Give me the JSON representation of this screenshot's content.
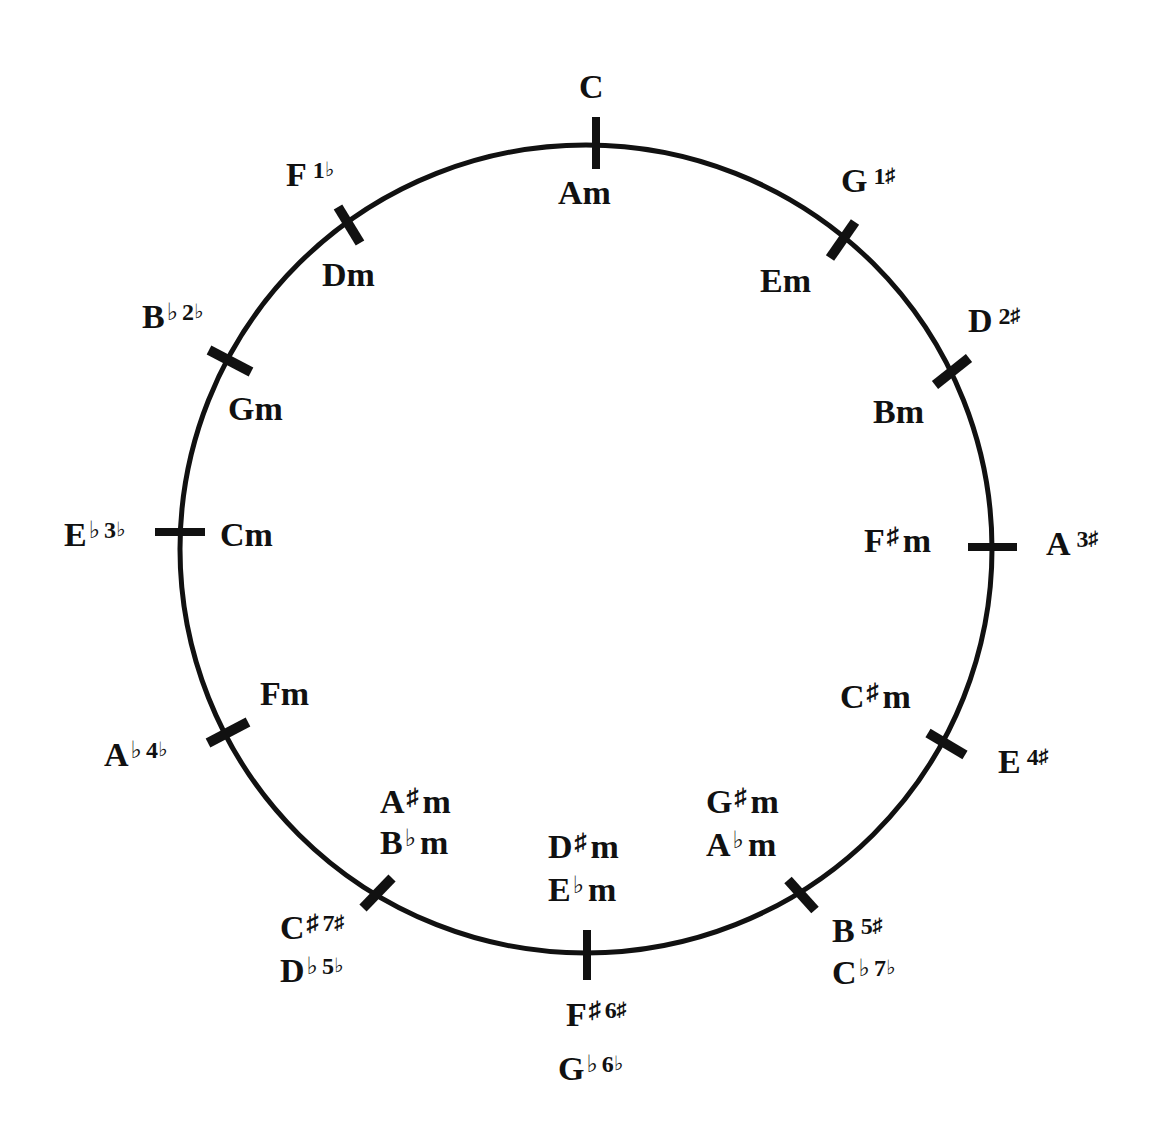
{
  "colors": {
    "ink": "#111111",
    "background": "#ffffff"
  },
  "circle": {
    "cx": 586,
    "cy": 549,
    "rx": 406,
    "ry": 404,
    "stroke_width": 5
  },
  "positions": [
    {
      "index": 0,
      "major": "C",
      "major_signature": "",
      "minor": [
        "Am"
      ],
      "tick_angle_deg": -89
    },
    {
      "index": 1,
      "major": "G",
      "major_signature": "1♯",
      "minor": [
        "Em"
      ],
      "tick_angle_deg": -58
    },
    {
      "index": 2,
      "major": "D",
      "major_signature": "2♯",
      "minor": [
        "Bm"
      ],
      "tick_angle_deg": -28
    },
    {
      "index": 3,
      "major": "A",
      "major_signature": "3♯",
      "minor": [
        "F♯m"
      ],
      "tick_angle_deg": 0
    },
    {
      "index": 4,
      "major": "E",
      "major_signature": "4♯",
      "minor": [
        "C♯m"
      ],
      "tick_angle_deg": 30
    },
    {
      "index": 5,
      "major": "B",
      "major_signature": "5♯",
      "enharmonic_major": "C♭",
      "enharmonic_signature": "7♭",
      "minor": [
        "G♯m",
        "A♭m"
      ],
      "tick_angle_deg": 59
    },
    {
      "index": 6,
      "major": "F♯",
      "major_signature": "6♯",
      "enharmonic_major": "G♭",
      "enharmonic_signature": "6♭",
      "minor": [
        "D♯m",
        "E♭m"
      ],
      "tick_angle_deg": 90
    },
    {
      "index": 7,
      "major": "C♯",
      "major_signature": "7♯",
      "enharmonic_major": "D♭",
      "enharmonic_signature": "5♭",
      "minor": [
        "A♯m",
        "B♭m"
      ],
      "tick_angle_deg": 122
    },
    {
      "index": 8,
      "major": "A♭",
      "major_signature": "4♭",
      "minor": [
        "Fm"
      ],
      "tick_angle_deg": 150
    },
    {
      "index": 9,
      "major": "E♭",
      "major_signature": "3♭",
      "minor": [
        "Cm"
      ],
      "tick_angle_deg": 180
    },
    {
      "index": 10,
      "major": "B♭",
      "major_signature": "2♭",
      "minor": [
        "Gm"
      ],
      "tick_angle_deg": -150
    },
    {
      "index": 11,
      "major": "F",
      "major_signature": "1♭",
      "minor": [
        "Dm"
      ],
      "tick_angle_deg": -120
    }
  ],
  "labels": {
    "C": {
      "letter": "C",
      "acc": "",
      "num": "",
      "numacc": ""
    },
    "Am": {
      "letter": "Am",
      "acc": ""
    },
    "G": {
      "letter": "G",
      "acc": "",
      "num": "1",
      "numacc": "♯"
    },
    "Em": {
      "letter": "Em"
    },
    "D": {
      "letter": "D",
      "acc": "",
      "num": "2",
      "numacc": "♯"
    },
    "Bm": {
      "letter": "Bm"
    },
    "A": {
      "letter": "A",
      "acc": "",
      "num": "3",
      "numacc": "♯"
    },
    "Fsm": {
      "letter": "F",
      "acc": "♯",
      "suffix": "m"
    },
    "E": {
      "letter": "E",
      "acc": "",
      "num": "4",
      "numacc": "♯"
    },
    "Csm": {
      "letter": "C",
      "acc": "♯",
      "suffix": "m"
    },
    "B": {
      "letter": "B",
      "acc": "",
      "num": "5",
      "numacc": "♯"
    },
    "Cb": {
      "letter": "C",
      "acc": "♭",
      "num": "7",
      "numacc": "♭"
    },
    "Gsm": {
      "letter": "G",
      "acc": "♯",
      "suffix": "m"
    },
    "Abm": {
      "letter": "A",
      "acc": "♭",
      "suffix": "m"
    },
    "Fs": {
      "letter": "F",
      "acc": "♯",
      "num": "6",
      "numacc": "♯"
    },
    "Gb": {
      "letter": "G",
      "acc": "♭",
      "num": "6",
      "numacc": "♭"
    },
    "Dsm": {
      "letter": "D",
      "acc": "♯",
      "suffix": "m"
    },
    "Ebm": {
      "letter": "E",
      "acc": "♭",
      "suffix": "m"
    },
    "Cs": {
      "letter": "C",
      "acc": "♯",
      "num": "7",
      "numacc": "♯"
    },
    "Db": {
      "letter": "D",
      "acc": "♭",
      "num": "5",
      "numacc": "♭"
    },
    "Asm": {
      "letter": "A",
      "acc": "♯",
      "suffix": "m"
    },
    "Bbm": {
      "letter": "B",
      "acc": "♭",
      "suffix": "m"
    },
    "Ab": {
      "letter": "A",
      "acc": "♭",
      "num": "4",
      "numacc": "♭"
    },
    "Fm": {
      "letter": "Fm"
    },
    "Eb": {
      "letter": "E",
      "acc": "♭",
      "num": "3",
      "numacc": "♭"
    },
    "Cm": {
      "letter": "Cm"
    },
    "Bb": {
      "letter": "B",
      "acc": "♭",
      "num": "2",
      "numacc": "♭"
    },
    "Gm": {
      "letter": "Gm"
    },
    "F": {
      "letter": "F",
      "acc": "",
      "num": "1",
      "numacc": "♭"
    },
    "Dm": {
      "letter": "Dm"
    }
  }
}
